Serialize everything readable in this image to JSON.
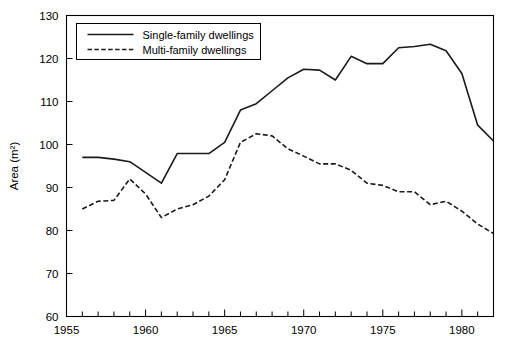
{
  "chart_data": {
    "type": "line",
    "title": "",
    "xlabel": "",
    "ylabel": "Area (m2)",
    "ylabel_display": "Area (m²)",
    "xlim": [
      1955,
      1982
    ],
    "ylim": [
      60,
      130
    ],
    "ytick_labels": [
      "60",
      "70",
      "80",
      "90",
      "100",
      "110",
      "120",
      "130"
    ],
    "ytick_values": [
      60,
      70,
      80,
      90,
      100,
      110,
      120,
      130
    ],
    "xtick_labels": [
      "1955",
      "1960",
      "1965",
      "1970",
      "1975",
      "1980"
    ],
    "xtick_values": [
      1955,
      1960,
      1965,
      1970,
      1975,
      1980
    ],
    "xtick_minor_values": [
      1956,
      1957,
      1958,
      1959,
      1961,
      1962,
      1963,
      1964,
      1966,
      1967,
      1968,
      1969,
      1971,
      1972,
      1973,
      1974,
      1976,
      1977,
      1978,
      1979,
      1981,
      1982
    ],
    "grid": false,
    "legend_position": "top-left",
    "x": [
      1956,
      1957,
      1958,
      1959,
      1960,
      1961,
      1962,
      1963,
      1964,
      1965,
      1966,
      1967,
      1968,
      1969,
      1970,
      1971,
      1972,
      1973,
      1974,
      1975,
      1976,
      1977,
      1978,
      1979,
      1980,
      1981,
      1982
    ],
    "series": [
      {
        "name": "Single-family dwellings",
        "style": "solid",
        "color": "#1a1a1a",
        "values": [
          97.0,
          97.0,
          96.6,
          96.0,
          93.5,
          91.0,
          97.9,
          97.9,
          97.9,
          100.5,
          108.0,
          109.5,
          112.5,
          115.5,
          117.5,
          117.3,
          115.0,
          120.5,
          118.8,
          118.8,
          122.5,
          122.8,
          123.3,
          121.8,
          116.5,
          104.5,
          100.8
        ]
      },
      {
        "name": "Multi-family dwellings",
        "style": "dashed",
        "color": "#1a1a1a",
        "values": [
          85.0,
          86.8,
          87.0,
          92.0,
          88.5,
          83.0,
          85.0,
          86.0,
          88.0,
          91.8,
          100.5,
          102.5,
          102.0,
          99.0,
          97.3,
          95.5,
          95.5,
          94.0,
          91.0,
          90.5,
          89.0,
          89.0,
          86.0,
          86.8,
          84.5,
          81.5,
          79.3
        ]
      }
    ]
  },
  "legend": {
    "items": [
      {
        "label": "Single-family dwellings",
        "style": "solid"
      },
      {
        "label": "Multi-family dwellings",
        "style": "dashed"
      }
    ]
  },
  "axes": {
    "y_title": "Area (m²)"
  }
}
